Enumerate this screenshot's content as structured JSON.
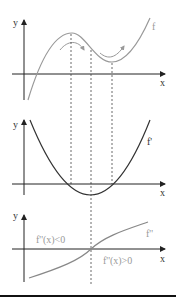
{
  "panels": {
    "top": {
      "y_label": "y",
      "x_label": "x",
      "curve_label": "f"
    },
    "middle": {
      "y_label": "y",
      "x_label": "x",
      "curve_label": "f'"
    },
    "bottom": {
      "y_label": "y",
      "x_label": "x",
      "curve_label": "f''",
      "neg_label": "f''(x)<0",
      "pos_label": "f''(x)>0"
    }
  },
  "colors": {
    "f": "#999999",
    "fprime": "#333333",
    "fsecond": "#888888",
    "axis": "#222222",
    "label_gray": "#999999",
    "label_dark": "#333333"
  }
}
